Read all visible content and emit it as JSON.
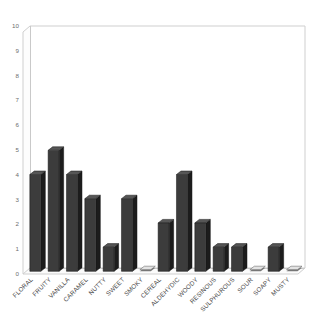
{
  "chart_data": {
    "type": "bar",
    "title": "",
    "subtitle": "",
    "xlabel": "",
    "ylabel": "",
    "ylim": [
      0,
      10
    ],
    "ytick_step": 1,
    "yticks": [
      "0",
      "1",
      "2",
      "3",
      "4",
      "5",
      "6",
      "7",
      "8",
      "9",
      "10"
    ],
    "grid": false,
    "legend": "none",
    "orientation": "vertical",
    "style": "3d-bar",
    "bar_color": "#3c3c3c",
    "categories": [
      "FLORAL",
      "FRUITY",
      "VANILLA",
      "CARAMEL",
      "NUTTY",
      "SWEET",
      "SMOKY",
      "CEREAL",
      "ALDEHYDIC",
      "WOODY",
      "RESINOUS",
      "SULPHUROUS",
      "SOUR",
      "SOAPY",
      "MUSTY"
    ],
    "values": [
      4,
      5,
      4,
      3,
      1,
      3,
      0,
      2,
      4,
      2,
      1,
      1,
      0,
      1,
      0
    ]
  }
}
